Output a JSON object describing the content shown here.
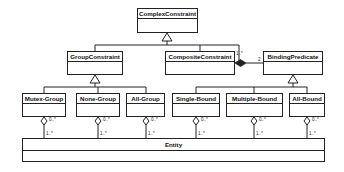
{
  "diagram": {
    "type": "uml-class-diagram",
    "classes": {
      "complex": "ComplexConstraint",
      "group": "GroupConstraint",
      "composite": "CompositeConstraint",
      "binding": "BindingPredicate",
      "mutex": "Mutex-Group",
      "none": "None-Group",
      "allgroup": "All-Group",
      "single": "Single-Bound",
      "multiple": "Multiple-Bound",
      "allbound": "All-Bound",
      "entity": "Entity"
    },
    "multiplicities": {
      "composite_self": "1..*",
      "composite_binding": "2",
      "agg_upper": "0..*",
      "agg_lower": "1..*"
    },
    "relations": [
      {
        "type": "generalization",
        "from": "GroupConstraint",
        "to": "ComplexConstraint"
      },
      {
        "type": "generalization",
        "from": "CompositeConstraint",
        "to": "ComplexConstraint"
      },
      {
        "type": "generalization",
        "from": "Mutex-Group",
        "to": "GroupConstraint"
      },
      {
        "type": "generalization",
        "from": "None-Group",
        "to": "GroupConstraint"
      },
      {
        "type": "generalization",
        "from": "All-Group",
        "to": "GroupConstraint"
      },
      {
        "type": "generalization",
        "from": "Single-Bound",
        "to": "BindingPredicate"
      },
      {
        "type": "generalization",
        "from": "Multiple-Bound",
        "to": "BindingPredicate"
      },
      {
        "type": "generalization",
        "from": "All-Bound",
        "to": "BindingPredicate"
      },
      {
        "type": "composition",
        "whole": "CompositeConstraint",
        "part": "ComplexConstraint",
        "multiplicity": "1..*"
      },
      {
        "type": "composition",
        "whole": "CompositeConstraint",
        "part": "BindingPredicate",
        "multiplicity": "2"
      },
      {
        "type": "aggregation",
        "whole": "Mutex-Group",
        "part": "Entity",
        "whole_mult": "0..*",
        "part_mult": "1..*"
      },
      {
        "type": "aggregation",
        "whole": "None-Group",
        "part": "Entity",
        "whole_mult": "0..*",
        "part_mult": "1..*"
      },
      {
        "type": "aggregation",
        "whole": "All-Group",
        "part": "Entity",
        "whole_mult": "0..*",
        "part_mult": "1..*"
      },
      {
        "type": "aggregation",
        "whole": "Single-Bound",
        "part": "Entity",
        "whole_mult": "0..*",
        "part_mult": "1..*"
      },
      {
        "type": "aggregation",
        "whole": "Multiple-Bound",
        "part": "Entity",
        "whole_mult": "0..*",
        "part_mult": "1..*"
      },
      {
        "type": "aggregation",
        "whole": "All-Bound",
        "part": "Entity",
        "whole_mult": "0..*",
        "part_mult": "1..*"
      }
    ]
  }
}
